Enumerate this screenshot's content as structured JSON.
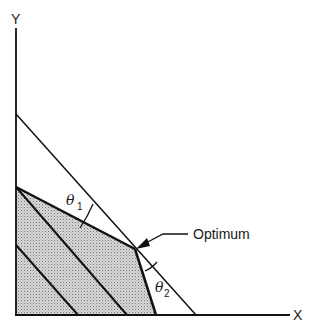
{
  "diagram": {
    "axes": {
      "x_label": "X",
      "y_label": "Y"
    },
    "feasible_region": {
      "fill": "#c8c8c8",
      "stroke": "#111111"
    },
    "objective_line": {
      "stroke": "#111111"
    },
    "annotations": {
      "optimum_label": "Optimum",
      "theta1_symbol": "θ",
      "theta1_subscript": "1",
      "theta2_symbol": "θ",
      "theta2_subscript": "2"
    }
  }
}
